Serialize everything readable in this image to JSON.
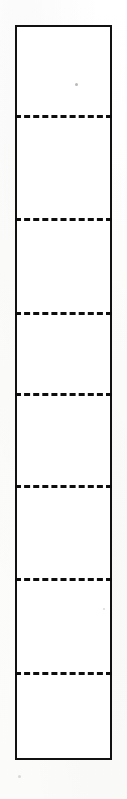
{
  "figure": {
    "medium": "scanned line drawing",
    "canvas": {
      "width": 127,
      "height": 799,
      "background_color": "#fdfdfc"
    },
    "outline": {
      "name": "strip-outline",
      "shape": "rectangle",
      "x": 15,
      "y": 25,
      "width": 97,
      "height": 735,
      "stroke_color": "#111111",
      "stroke_width": 2.5,
      "fill_color": "#ffffff"
    },
    "dividers": {
      "count": 7,
      "style": "dashed",
      "stroke_color": "#0d0d0d",
      "stroke_width": 3,
      "dash_length": 14,
      "dash_gap": 7,
      "positions_y": [
        115,
        218,
        312,
        393,
        485,
        578,
        672
      ]
    },
    "cells": {
      "count": 8,
      "heights": [
        90,
        103,
        94,
        81,
        92,
        93,
        94,
        88
      ]
    },
    "artifacts": [
      {
        "name": "scan-speck",
        "x": 75,
        "y": 83,
        "size": 3
      },
      {
        "name": "scan-speck",
        "x": 103,
        "y": 608,
        "size": 2
      },
      {
        "name": "scan-speck",
        "x": 18,
        "y": 775,
        "size": 3
      }
    ]
  }
}
